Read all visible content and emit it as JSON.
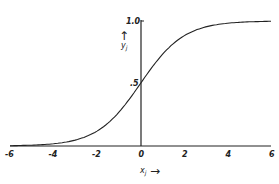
{
  "chart_data": {
    "type": "line",
    "title": "",
    "xlabel": "x_j",
    "ylabel": "y_j",
    "xlim": [
      -6,
      6
    ],
    "ylim": [
      0,
      1.0
    ],
    "x_ticks": [
      "-6",
      "-4",
      "-2",
      "0",
      "2",
      "4",
      "6"
    ],
    "y_ticks": [
      ".5",
      "1.0"
    ],
    "grid": false,
    "legend": null,
    "series": [
      {
        "name": "logistic sigmoid y = 1/(1+e^-x)",
        "x": [
          -6,
          -5,
          -4,
          -3,
          -2,
          -1,
          0,
          1,
          2,
          3,
          4,
          5,
          6
        ],
        "values": [
          0.0025,
          0.0067,
          0.018,
          0.047,
          0.119,
          0.269,
          0.5,
          0.731,
          0.881,
          0.953,
          0.982,
          0.993,
          0.9975
        ]
      }
    ]
  },
  "labels": {
    "x_axis_label": "x",
    "x_axis_sub": "j",
    "y_axis_label": "y",
    "y_axis_sub": "j",
    "x_arrow": "→",
    "y_arrow": "↑"
  }
}
